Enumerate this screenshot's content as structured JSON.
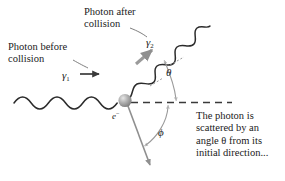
{
  "figure": {
    "topic": "Compton scattering diagram",
    "background_color": "#ffffff",
    "ink_color": "#2b2b2b",
    "accent_gray": "#9a9a9a",
    "sphere_color": "#a8a8a8"
  },
  "labels": {
    "photon_before": "Photon before\ncollision",
    "photon_after": "Photon after\ncollision",
    "callout": "The photon is\nscattered by an\nangle θ from its\ninitial direction..."
  },
  "symbols": {
    "gamma_incident": "γ",
    "gamma_incident_sub": "1",
    "gamma_scattered": "γ",
    "gamma_scattered_sub": "2",
    "electron": "e",
    "electron_sup": "−",
    "theta": "θ",
    "phi": "ϕ"
  },
  "elements": {
    "incident_wave": "incoming photon wave",
    "scattered_wave": "outgoing photon wave",
    "axis": "dashed initial-direction axis",
    "recoil_arrow": "electron recoil arrow",
    "direction_arrow": "incident direction arrow",
    "pointer_arrow": "gray pointer to scattered photon",
    "theta_arc": "scattering angle arc",
    "phi_arc": "recoil angle arc"
  }
}
